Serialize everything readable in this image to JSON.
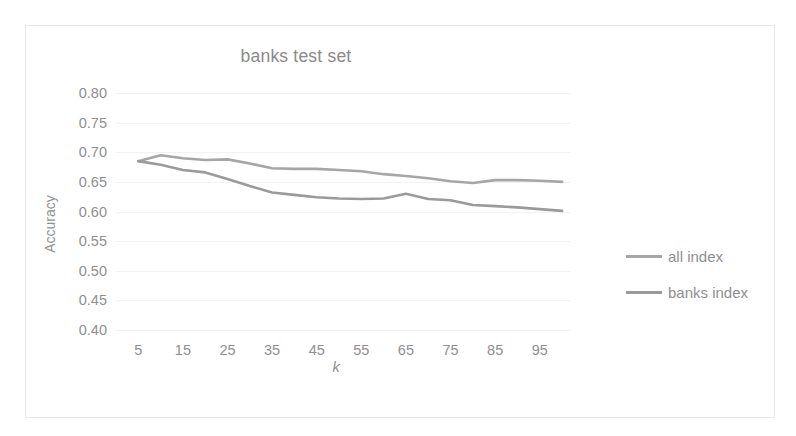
{
  "chart_data": {
    "type": "line",
    "title": "banks test set",
    "xlabel": "k",
    "ylabel": "Accuracy",
    "xlim": [
      0,
      102
    ],
    "ylim": [
      0.4,
      0.8
    ],
    "grid": true,
    "legend_position": "right",
    "y_ticks": [
      "0.80",
      "0.75",
      "0.70",
      "0.65",
      "0.60",
      "0.55",
      "0.50",
      "0.45",
      "0.40"
    ],
    "y_tick_values": [
      0.8,
      0.75,
      0.7,
      0.65,
      0.6,
      0.55,
      0.5,
      0.45,
      0.4
    ],
    "x_ticks": [
      "5",
      "15",
      "25",
      "35",
      "45",
      "55",
      "65",
      "75",
      "85",
      "95"
    ],
    "x_tick_values": [
      5,
      15,
      25,
      35,
      45,
      55,
      65,
      75,
      85,
      95
    ],
    "x": [
      5,
      10,
      15,
      20,
      25,
      30,
      35,
      40,
      45,
      50,
      55,
      60,
      65,
      70,
      75,
      80,
      85,
      90,
      95,
      100
    ],
    "series": [
      {
        "name": "all index",
        "color": "#a6a6a6",
        "values": [
          0.685,
          0.695,
          0.69,
          0.687,
          0.688,
          0.681,
          0.673,
          0.672,
          0.672,
          0.67,
          0.668,
          0.663,
          0.66,
          0.656,
          0.651,
          0.648,
          0.653,
          0.653,
          0.652,
          0.65
        ]
      },
      {
        "name": "banks index",
        "color": "#9a9a9a",
        "values": [
          0.685,
          0.679,
          0.67,
          0.666,
          0.655,
          0.643,
          0.632,
          0.628,
          0.624,
          0.622,
          0.621,
          0.622,
          0.63,
          0.621,
          0.619,
          0.611,
          0.609,
          0.607,
          0.604,
          0.601
        ]
      }
    ]
  },
  "legend": {
    "entries": [
      {
        "label": "all index"
      },
      {
        "label": "banks index"
      }
    ]
  },
  "colors": {
    "all_index": "#a6a6a6",
    "banks_index": "#9a9a9a",
    "text": "#8f8f8f",
    "gridline": "#f2f2f2",
    "frame_border": "#e8e8e8"
  }
}
